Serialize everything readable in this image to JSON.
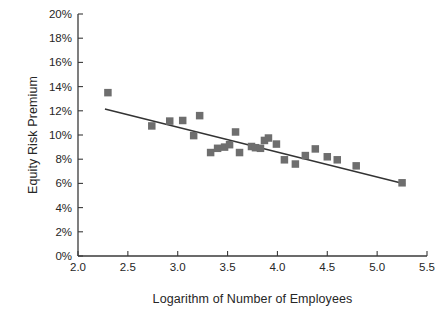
{
  "chart_data": {
    "type": "scatter",
    "title": "",
    "xlabel": "Logarithm of Number of Employees",
    "ylabel": "Equity Risk Premium",
    "xlim": [
      2.0,
      5.5
    ],
    "ylim": [
      0,
      20
    ],
    "x_ticks": [
      "2.0",
      "2.5",
      "3.0",
      "3.5",
      "4.0",
      "4.5",
      "5.0",
      "5.5"
    ],
    "x_tick_values": [
      2.0,
      2.5,
      3.0,
      3.5,
      4.0,
      4.5,
      5.0,
      5.5
    ],
    "y_ticks": [
      "0%",
      "2%",
      "4%",
      "6%",
      "8%",
      "10%",
      "12%",
      "14%",
      "16%",
      "18%",
      "20%"
    ],
    "y_tick_values": [
      0,
      2,
      4,
      6,
      8,
      10,
      12,
      14,
      16,
      18,
      20
    ],
    "grid": false,
    "legend": false,
    "marker_shape": "square",
    "marker_color": "#6e6e6e",
    "line_color": "#333333",
    "axis_color": "#3a3a3a",
    "points": [
      {
        "x": 2.3,
        "y": 13.5
      },
      {
        "x": 2.74,
        "y": 10.75
      },
      {
        "x": 2.92,
        "y": 11.15
      },
      {
        "x": 3.05,
        "y": 11.2
      },
      {
        "x": 3.16,
        "y": 9.95
      },
      {
        "x": 3.22,
        "y": 11.6
      },
      {
        "x": 3.33,
        "y": 8.55
      },
      {
        "x": 3.4,
        "y": 8.9
      },
      {
        "x": 3.47,
        "y": 9.0
      },
      {
        "x": 3.52,
        "y": 9.2
      },
      {
        "x": 3.58,
        "y": 10.25
      },
      {
        "x": 3.62,
        "y": 8.55
      },
      {
        "x": 3.74,
        "y": 9.05
      },
      {
        "x": 3.78,
        "y": 8.95
      },
      {
        "x": 3.83,
        "y": 8.9
      },
      {
        "x": 3.87,
        "y": 9.55
      },
      {
        "x": 3.91,
        "y": 9.75
      },
      {
        "x": 3.99,
        "y": 9.25
      },
      {
        "x": 4.07,
        "y": 7.95
      },
      {
        "x": 4.18,
        "y": 7.6
      },
      {
        "x": 4.28,
        "y": 8.3
      },
      {
        "x": 4.38,
        "y": 8.85
      },
      {
        "x": 4.5,
        "y": 8.2
      },
      {
        "x": 4.6,
        "y": 7.95
      },
      {
        "x": 4.79,
        "y": 7.45
      },
      {
        "x": 5.25,
        "y": 6.05
      }
    ],
    "trend_line": {
      "name": "linear fit",
      "x_start": 2.27,
      "y_start": 12.15,
      "x_end": 5.28,
      "y_end": 5.95
    }
  }
}
